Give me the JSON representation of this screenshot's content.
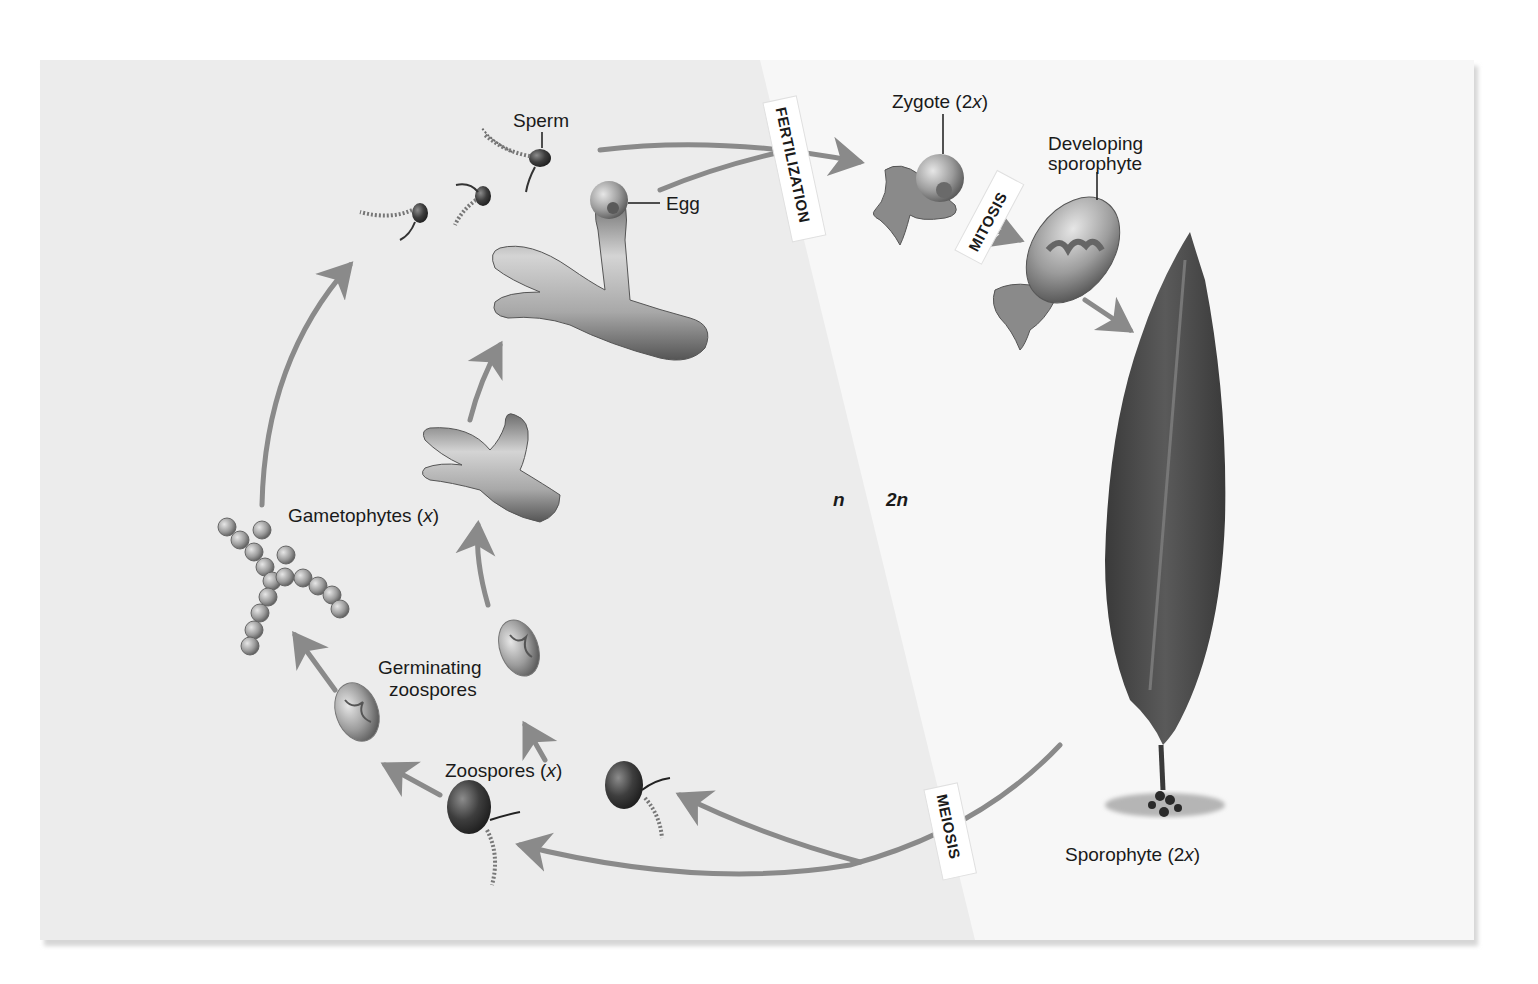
{
  "diagram": {
    "type": "life-cycle",
    "panel": {
      "haploid_bg": "#ececec",
      "diploid_bg": "#f7f7f7",
      "shadow": "#cfcfcf"
    },
    "colors": {
      "arrow": "#8a8a8a",
      "text": "#1a1a1a",
      "blade": "#4a4a4a",
      "cell": "#9a9a9a",
      "zoospore": "#3c3c3c"
    },
    "phases": {
      "haploid": "n",
      "diploid": "2n"
    },
    "processes": {
      "fertilization": "FERTILIZATION",
      "mitosis": "MITOSIS",
      "meiosis": "MEIOSIS"
    },
    "labels": {
      "sperm": "Sperm",
      "egg": "Egg",
      "zygote_main": "Zygote (2",
      "zygote_var": "x",
      "zygote_close": ")",
      "developing_line1": "Developing",
      "developing_line2": "sporophyte",
      "gametophytes_main": "Gametophytes (",
      "gametophytes_var": "x",
      "gametophytes_close": ")",
      "germinating_line1": "Germinating",
      "germinating_line2": "zoospores",
      "zoospores_main": "Zoospores (",
      "zoospores_var": "x",
      "zoospores_close": ")",
      "sporophyte_main": "Sporophyte (2",
      "sporophyte_var": "x",
      "sporophyte_close": ")"
    },
    "stages": [
      {
        "id": "zoospores",
        "ploidy": "x"
      },
      {
        "id": "germinating-zoospores",
        "ploidy": "x"
      },
      {
        "id": "gametophytes",
        "ploidy": "x"
      },
      {
        "id": "sperm-egg",
        "ploidy": "x"
      },
      {
        "id": "zygote",
        "ploidy": "2x"
      },
      {
        "id": "developing-sporophyte",
        "ploidy": "2x"
      },
      {
        "id": "sporophyte",
        "ploidy": "2x"
      }
    ]
  }
}
